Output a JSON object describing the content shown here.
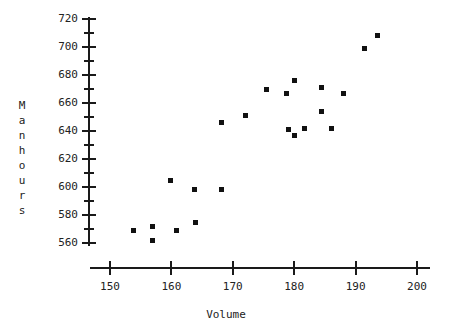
{
  "chart_data": {
    "type": "scatter",
    "title": "",
    "xlabel": "Volume",
    "ylabel": "Manhours",
    "xlim": [
      145,
      203
    ],
    "ylim": [
      553,
      726
    ],
    "xticks": [
      150,
      160,
      170,
      180,
      190,
      200
    ],
    "yticks": [
      560,
      580,
      600,
      620,
      640,
      660,
      680,
      700,
      720
    ],
    "y_minor_ticks": [
      570,
      590,
      610,
      630,
      650,
      670,
      690,
      710
    ],
    "grid": false,
    "legend": null,
    "marker": "square",
    "marker_color": "#111111",
    "points": [
      {
        "x": 153.9,
        "y": 569
      },
      {
        "x": 157.0,
        "y": 572
      },
      {
        "x": 157.0,
        "y": 562
      },
      {
        "x": 160.9,
        "y": 569
      },
      {
        "x": 164.0,
        "y": 575
      },
      {
        "x": 159.9,
        "y": 605
      },
      {
        "x": 163.7,
        "y": 598
      },
      {
        "x": 168.2,
        "y": 598
      },
      {
        "x": 168.1,
        "y": 646
      },
      {
        "x": 172.0,
        "y": 651
      },
      {
        "x": 175.5,
        "y": 670
      },
      {
        "x": 178.7,
        "y": 667
      },
      {
        "x": 179.1,
        "y": 641
      },
      {
        "x": 180.1,
        "y": 637
      },
      {
        "x": 180.1,
        "y": 676
      },
      {
        "x": 181.6,
        "y": 642
      },
      {
        "x": 184.4,
        "y": 671
      },
      {
        "x": 184.4,
        "y": 654
      },
      {
        "x": 186.1,
        "y": 642
      },
      {
        "x": 188.0,
        "y": 667
      },
      {
        "x": 191.5,
        "y": 699
      },
      {
        "x": 193.6,
        "y": 708
      }
    ]
  },
  "axes": {
    "x_axis_title": "Volume",
    "y_axis_title_chars": [
      "M",
      "a",
      "n",
      "h",
      "o",
      "u",
      "r",
      "s"
    ],
    "x_tick_labels": [
      "150",
      "160",
      "170",
      "180",
      "190",
      "200"
    ],
    "y_tick_labels": [
      "720",
      "700",
      "680",
      "660",
      "640",
      "620",
      "600",
      "580",
      "560"
    ]
  }
}
